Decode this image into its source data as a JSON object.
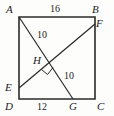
{
  "figure": {
    "shape": "square",
    "stroke_color": "#2b2b2b",
    "background_color": "#fdfdfc",
    "vertices": [
      {
        "id": "A",
        "label": "A",
        "position": "top-left"
      },
      {
        "id": "B",
        "label": "B",
        "position": "top-right"
      },
      {
        "id": "C",
        "label": "C",
        "position": "bottom-right"
      },
      {
        "id": "D",
        "label": "D",
        "position": "bottom-left"
      },
      {
        "id": "E",
        "label": "E",
        "position": "left-edge"
      },
      {
        "id": "F",
        "label": "F",
        "position": "right-edge"
      },
      {
        "id": "G",
        "label": "G",
        "position": "bottom-edge"
      },
      {
        "id": "H",
        "label": "H",
        "position": "intersection"
      }
    ],
    "measures": [
      {
        "id": "top",
        "value": "16",
        "segment": "AB"
      },
      {
        "id": "upper",
        "value": "10",
        "segment": "AH"
      },
      {
        "id": "lower",
        "value": "10",
        "segment": "HF"
      },
      {
        "id": "bottom",
        "value": "12",
        "segment": "DG"
      }
    ],
    "right_angle_at": "H"
  }
}
